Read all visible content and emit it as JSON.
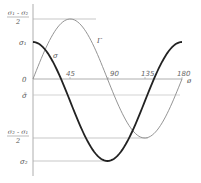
{
  "diagram": {
    "title": "",
    "x_axis": {
      "label": "ø",
      "ticks": [
        "45",
        "90",
        "135",
        "180"
      ]
    },
    "y_labels": {
      "tau_max": {
        "num": "σ₁ - σ₂",
        "den": "2"
      },
      "sigma1": "σ₁",
      "zero": "0",
      "sigma_bar": "σ̄",
      "tau_min": {
        "num": "σ₂ - σ₁",
        "den": "2"
      },
      "sigma2": "σ₂"
    },
    "curves": {
      "sigma": {
        "label": "σ",
        "color": "#222222"
      },
      "tau": {
        "label": "Γ",
        "color": "#888888"
      }
    },
    "colors": {
      "axis": "#9a9a9a",
      "guide": "#b0b0b0",
      "text": "#555555"
    }
  },
  "chart_data": {
    "type": "line",
    "title": "",
    "xlabel": "ø (degrees)",
    "ylabel": "",
    "x": [
      0,
      45,
      90,
      135,
      180
    ],
    "xlim": [
      0,
      180
    ],
    "series": [
      {
        "name": "σ (normal stress)",
        "formula": "σ̄ + ((σ₁-σ₂)/2)·cos(2ø)",
        "values_symbolic": [
          "σ₁",
          "σ̄",
          "σ₂",
          "σ̄",
          "σ₁"
        ]
      },
      {
        "name": "Γ (shear stress)",
        "formula": "((σ₁-σ₂)/2)·sin(2ø)",
        "values_symbolic": [
          "0",
          "(σ₁-σ₂)/2",
          "0",
          "(σ₂-σ₁)/2",
          "0"
        ]
      }
    ],
    "y_reference_levels": [
      "(σ₁-σ₂)/2",
      "σ₁",
      "0",
      "σ̄",
      "(σ₂-σ₁)/2",
      "σ₂"
    ],
    "grid": false
  }
}
